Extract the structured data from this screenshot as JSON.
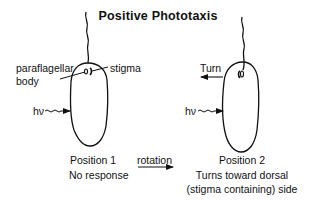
{
  "title": "Positive Phototaxis",
  "left_cell": {
    "labels": {
      "paraflagellar_line1": "paraflagellar",
      "paraflagellar_line2": "body",
      "stigma": "stigma",
      "light": "hν"
    },
    "caption": {
      "position": "Position 1",
      "response": "No response"
    }
  },
  "transition": {
    "label": "rotation"
  },
  "right_cell": {
    "labels": {
      "turn": "Turn",
      "light": "hν"
    },
    "caption": {
      "position": "Position 2",
      "response_line1": "Turns toward dorsal",
      "response_line2": "(stigma containing) side"
    }
  },
  "colors": {
    "line": "#111111",
    "background": "#ffffff"
  }
}
